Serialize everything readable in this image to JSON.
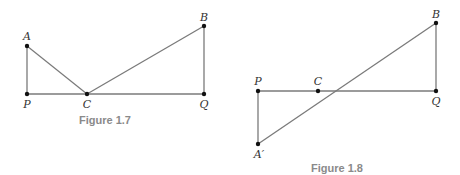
{
  "figures": [
    {
      "caption": "Figure 1.7",
      "points": {
        "A": {
          "label": "A",
          "x": 27,
          "y": 46
        },
        "P": {
          "label": "P",
          "x": 27,
          "y": 94
        },
        "C": {
          "label": "C",
          "x": 87,
          "y": 94
        },
        "B": {
          "label": "B",
          "x": 204,
          "y": 26
        },
        "Q": {
          "label": "Q",
          "x": 204,
          "y": 94
        }
      },
      "segments": [
        [
          "A",
          "P"
        ],
        [
          "P",
          "Q"
        ],
        [
          "A",
          "C"
        ],
        [
          "C",
          "B"
        ],
        [
          "B",
          "Q"
        ]
      ]
    },
    {
      "caption": "Figure 1.8",
      "points": {
        "P": {
          "label": "P",
          "x": 258,
          "y": 91
        },
        "C": {
          "label": "C",
          "x": 318,
          "y": 91
        },
        "Q": {
          "label": "Q",
          "x": 436,
          "y": 91
        },
        "B": {
          "label": "B",
          "x": 436,
          "y": 23
        },
        "A'": {
          "label": "A′",
          "x": 258,
          "y": 144
        }
      },
      "segments": [
        [
          "P",
          "Q"
        ],
        [
          "P",
          "A'"
        ],
        [
          "A'",
          "B"
        ],
        [
          "B",
          "Q"
        ]
      ]
    }
  ],
  "colors": {
    "line": "#7a7a7a",
    "point": "#111111",
    "caption": "#8a8a8a"
  }
}
